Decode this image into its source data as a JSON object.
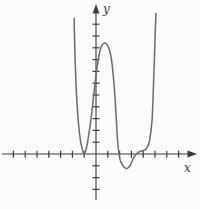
{
  "figure": {
    "background": "#fbfbfa",
    "axis_color": "#3b3b3b",
    "curve_color": "#6a6a6a",
    "x_label": "x",
    "y_label": "y"
  },
  "chart_data": {
    "type": "line",
    "title": "",
    "xlabel": "x",
    "ylabel": "y",
    "axes": {
      "x_ticks_min": -7,
      "x_ticks_max": 7,
      "y_ticks_min": -3,
      "y_ticks_max": 11,
      "tick_step": 1,
      "grid": false,
      "xlim": [
        -7.9,
        8.6
      ],
      "ylim": [
        -4.7,
        12.7
      ],
      "legend": "none"
    },
    "series": [
      {
        "name": "polynomial-curve",
        "points": [
          [
            -1.86,
            11.5
          ],
          [
            -1.74,
            7.1
          ],
          [
            -1.57,
            3.7
          ],
          [
            -1.36,
            1.4
          ],
          [
            -1.14,
            0.35
          ],
          [
            -1.0,
            0.0
          ],
          [
            -0.81,
            0.5
          ],
          [
            -0.64,
            1.45
          ],
          [
            -0.38,
            3.3
          ],
          [
            -0.13,
            5.6
          ],
          [
            0.13,
            7.6
          ],
          [
            0.38,
            8.9
          ],
          [
            0.72,
            9.4
          ],
          [
            1.06,
            9.05
          ],
          [
            1.31,
            8.0
          ],
          [
            1.53,
            5.85
          ],
          [
            1.69,
            3.55
          ],
          [
            1.82,
            1.2
          ],
          [
            1.95,
            0.0
          ],
          [
            2.08,
            -0.6
          ],
          [
            2.33,
            -1.05
          ],
          [
            2.63,
            -1.23
          ],
          [
            2.92,
            -0.93
          ],
          [
            3.18,
            -0.34
          ],
          [
            3.43,
            0.0
          ],
          [
            3.69,
            0.2
          ],
          [
            4.03,
            0.3
          ],
          [
            4.28,
            0.47
          ],
          [
            4.53,
            1.1
          ],
          [
            4.75,
            2.9
          ],
          [
            4.87,
            5.85
          ],
          [
            5.0,
            9.65
          ],
          [
            5.08,
            11.9
          ]
        ]
      }
    ],
    "annotations": {
      "touch_point_double_root": [
        -1,
        0
      ],
      "x_intercepts_read": [
        -1,
        1.95,
        3.43
      ],
      "local_max_read": [
        0.72,
        9.4
      ],
      "local_min_read": [
        2.63,
        -1.23
      ]
    }
  }
}
